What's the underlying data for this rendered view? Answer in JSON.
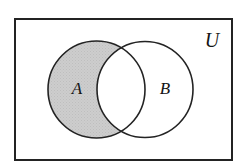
{
  "figure": {
    "kind": "venn-diagram",
    "background_color": "#ffffff"
  },
  "universe": {
    "label": "U",
    "border_color": "#232323",
    "fill_color": "#ffffff",
    "x": 15,
    "y": 19,
    "width": 217,
    "height": 141,
    "border_width": 2,
    "label_x": 212,
    "label_y": 42,
    "label_size": 20
  },
  "sets": [
    {
      "id": "set-a",
      "label": "A",
      "cx": 96.5,
      "cy": 89.5,
      "r": 48.5,
      "stroke_color": "#232323",
      "stroke_width": 1.6,
      "fill_color": "#ffffff",
      "label_x": 77,
      "label_y": 90,
      "label_size": 17
    },
    {
      "id": "set-b",
      "label": "B",
      "cx": 145,
      "cy": 89.5,
      "r": 48,
      "stroke_color": "#232323",
      "stroke_width": 1.6,
      "fill_color": "#ffffff",
      "label_x": 165,
      "label_y": 90,
      "label_size": 17
    }
  ],
  "shading": {
    "region": "A \\ B",
    "description": "A minus B (elements in A but not in B)",
    "color": "#cccccc",
    "texture": "fine stipple",
    "intersection_shaded": false
  }
}
